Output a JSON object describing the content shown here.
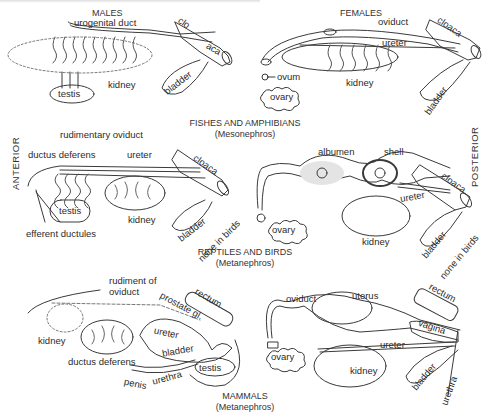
{
  "figure": {
    "orientation": {
      "left": "ANTERIOR",
      "right": "POSTERIOR"
    },
    "columns": {
      "males": "MALES",
      "females": "FEMALES"
    },
    "sections": [
      {
        "title": "FISHES AND AMPHIBIANS",
        "subtitle": "(Mesonephros)",
        "male_labels": {
          "urogenital_duct": "urogenital duct",
          "clo": "clo",
          "aca": "aca",
          "bladder": "bladder",
          "testis": "testis",
          "kidney": "kidney"
        },
        "female_labels": {
          "oviduct": "oviduct",
          "cloaca": "cloaca",
          "ureter": "ureter",
          "ovum": "ovum",
          "ovary": "ovary",
          "kidney": "kidney",
          "bladder": "bladder"
        }
      },
      {
        "title": "REPTILES AND BIRDS",
        "subtitle": "(Metanephros)",
        "male_labels": {
          "rudimentary_oviduct": "rudimentary oviduct",
          "ductus_deferens": "ductus deferens",
          "ureter": "ureter",
          "cloaca": "cloaca",
          "testis": "testis",
          "kidney": "kidney",
          "bladder": "bladder",
          "none_in_birds": "none in birds",
          "efferent_ductules": "efferent ductules"
        },
        "female_labels": {
          "albumen": "albumen",
          "shell": "shell",
          "cloaca": "cloaca",
          "ureter": "ureter",
          "ovary": "ovary",
          "kidney": "kidney",
          "bladder": "bladder",
          "none_in_birds": "none in birds"
        }
      },
      {
        "title": "MAMMALS",
        "subtitle": "(Metanephros)",
        "male_labels": {
          "rudiment_of_oviduct": "rudiment of oviduct",
          "rudiment_line1": "rudiment of",
          "rudiment_line2": "oviduct",
          "rectum": "rectum",
          "prostate": "prostate gl.",
          "kidney": "kidney",
          "ureter": "ureter",
          "bladder": "bladder",
          "ductus_deferens": "ductus deferens",
          "testis": "testis",
          "urethra": "urethra",
          "penis": "penis"
        },
        "female_labels": {
          "oviduct": "oviduct",
          "uterus": "uterus",
          "rectum": "rectum",
          "vagina": "vagina",
          "ureter": "ureter",
          "ovary": "ovary",
          "kidney": "kidney",
          "bladder": "bladder",
          "urethra": "urethra"
        }
      }
    ]
  }
}
